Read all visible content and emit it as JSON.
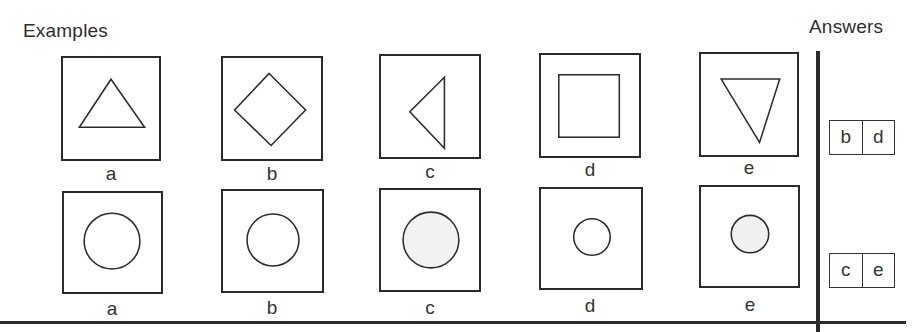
{
  "headings": {
    "examples": "Examples",
    "answers": "Answers"
  },
  "rows": [
    {
      "figures": [
        {
          "label": "a",
          "shape": "triangle-up-outline"
        },
        {
          "label": "b",
          "shape": "diamond-outline"
        },
        {
          "label": "c",
          "shape": "triangle-left-outline"
        },
        {
          "label": "d",
          "shape": "square-outline"
        },
        {
          "label": "e",
          "shape": "triangle-down-outline"
        }
      ],
      "answer": [
        "b",
        "d"
      ]
    },
    {
      "figures": [
        {
          "label": "a",
          "shape": "circle-outline-large"
        },
        {
          "label": "b",
          "shape": "circle-outline-medium"
        },
        {
          "label": "c",
          "shape": "circle-shaded-large"
        },
        {
          "label": "d",
          "shape": "circle-outline-small"
        },
        {
          "label": "e",
          "shape": "circle-shaded-small"
        }
      ],
      "answer": [
        "c",
        "e"
      ]
    }
  ]
}
